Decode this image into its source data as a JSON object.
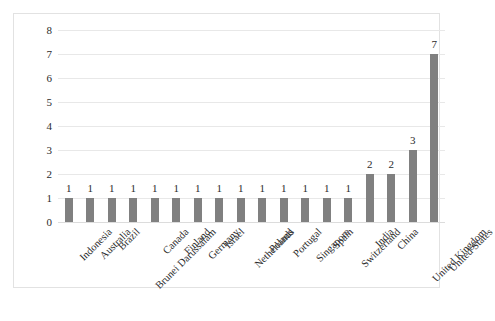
{
  "chart_data": {
    "type": "bar",
    "title": "",
    "subtitle": "",
    "xlabel": "",
    "ylabel": "",
    "ylim": [
      0,
      8
    ],
    "ytick_values": [
      0,
      1,
      2,
      3,
      4,
      5,
      6,
      7,
      8
    ],
    "ytick_labels": [
      "0",
      "1",
      "2",
      "3",
      "4",
      "5",
      "6",
      "7",
      "8"
    ],
    "grid": true,
    "legend": false,
    "legend_position": "none",
    "bar_color": "#808080",
    "gridline_color": "#e8e8e8",
    "border_color": "#e2e2e2",
    "label_color": "#2b2b2b",
    "categories": [
      "Indonesia",
      "Australia",
      "Brazil",
      "Brunei Darussalam",
      "Canada",
      "Finland",
      "Germany",
      "Israel",
      "Netherlands",
      "Poland",
      "Portugal",
      "Singapore",
      "Spain",
      "Switzerland",
      "India",
      "China",
      "United Kingdom",
      "United States"
    ],
    "values": [
      1,
      1,
      1,
      1,
      1,
      1,
      1,
      1,
      1,
      1,
      1,
      1,
      1,
      1,
      2,
      2,
      3,
      7
    ],
    "data_labels": [
      "1",
      "1",
      "1",
      "1",
      "1",
      "1",
      "1",
      "1",
      "1",
      "1",
      "1",
      "1",
      "1",
      "1",
      "2",
      "2",
      "3",
      "7"
    ]
  }
}
